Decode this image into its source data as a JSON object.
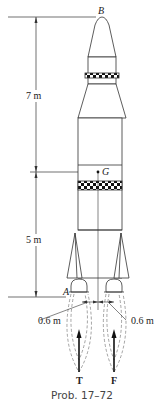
{
  "figure": {
    "caption": "Prob. 17–72",
    "points": {
      "top": "B",
      "center_of_mass": "G",
      "bottom": "A"
    },
    "dimensions": {
      "upper": "7 m",
      "lower": "5 m",
      "left_offset": "0.6 m",
      "right_offset": "0.6 m"
    },
    "forces": {
      "left": "T",
      "right": "F"
    }
  }
}
